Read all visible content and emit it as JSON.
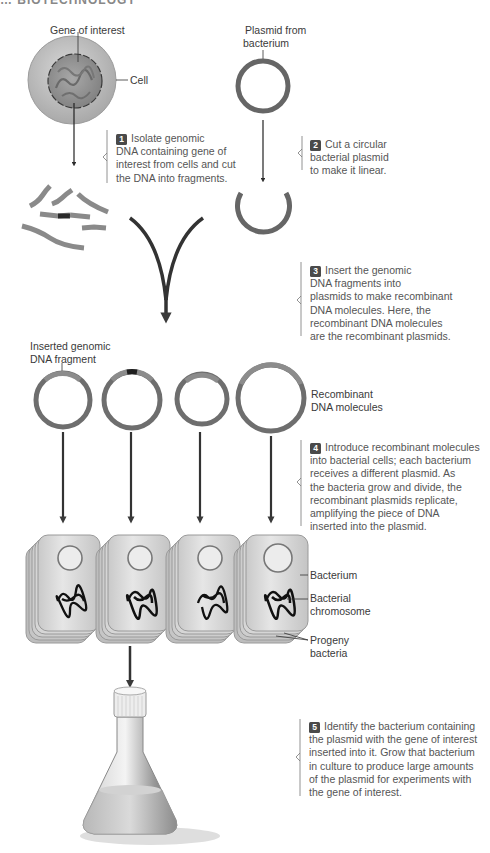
{
  "header": {
    "title": "…  BIOTECHNOLOGY"
  },
  "labels": {
    "gene_of_interest": "Gene of interest",
    "cell": "Cell",
    "plasmid_from_bacterium_1": "Plasmid from",
    "plasmid_from_bacterium_2": "bacterium",
    "inserted_fragment_1": "Inserted genomic",
    "inserted_fragment_2": "DNA fragment",
    "recombinant_1": "Recombinant",
    "recombinant_2": "DNA molecules",
    "bacterium": "Bacterium",
    "bacterial_chromosome_1": "Bacterial",
    "bacterial_chromosome_2": "chromosome",
    "progeny_1": "Progeny",
    "progeny_2": "bacteria"
  },
  "steps": [
    {
      "number": "1",
      "lines": [
        "Isolate genomic",
        "DNA containing gene of",
        "interest from cells and cut",
        "the DNA into fragments."
      ]
    },
    {
      "number": "2",
      "lines": [
        "Cut a circular",
        "bacterial plasmid",
        "to make it linear."
      ]
    },
    {
      "number": "3",
      "lines": [
        "Insert the genomic",
        "DNA fragments into",
        "plasmids to make recombinant",
        "DNA molecules. Here, the",
        "recombinant DNA molecules",
        "are the recombinant plasmids."
      ]
    },
    {
      "number": "4",
      "lines": [
        "Introduce recombinant molecules",
        "into bacterial cells; each bacterium",
        "receives a different plasmid. As",
        "the bacteria grow and divide, the",
        "recombinant plasmids replicate,",
        "amplifying the piece of DNA",
        "inserted into the plasmid."
      ]
    },
    {
      "number": "5",
      "lines": [
        "Identify the bacterium containing",
        "the plasmid with the gene of interest",
        "inserted into it. Grow that bacterium",
        "in culture to produce large amounts",
        "of the plasmid for experiments with",
        "the gene of interest."
      ]
    }
  ],
  "colors": {
    "plasmid": "#6e6e6e",
    "fragment": "#8a8a8a",
    "insert_dark": "#2a2a2a",
    "cell_outer": "#bdbdbd",
    "nucleus": "#9a9a9a",
    "bacterium_fill": "#dcdcdc",
    "arrow": "#2b2b2b",
    "text": "#555555"
  }
}
